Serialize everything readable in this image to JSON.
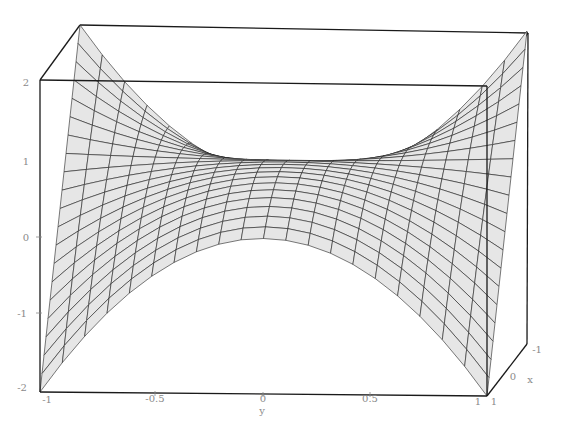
{
  "chart_data": {
    "type": "surface3d",
    "title": "",
    "function": "z = 2*x*y^2 style twisted saddle (visual estimate)",
    "x_range": [
      -1,
      1
    ],
    "y_range": [
      -1,
      1
    ],
    "z_range": [
      -2,
      2
    ],
    "xlabel": "x",
    "ylabel": "y",
    "zlabel": "",
    "x_ticks": [
      "-1",
      "0",
      "1"
    ],
    "y_ticks": [
      "-1",
      "-0.5",
      "0",
      "0.5",
      "1"
    ],
    "z_ticks": [
      "2",
      "1",
      "0",
      "-1",
      "-2"
    ],
    "grid": false,
    "mesh_lines": 20,
    "shading": {
      "top_face": "#e6e6e6",
      "bottom_face": "#9a9a9a"
    },
    "sample_points": [
      {
        "x": -1,
        "y": -1,
        "z": 2
      },
      {
        "x": 1,
        "y": -1,
        "z": -2
      },
      {
        "x": -1,
        "y": 1,
        "z": 2
      },
      {
        "x": 1,
        "y": 1,
        "z": -2
      },
      {
        "x": 0,
        "y": 0,
        "z": 0
      }
    ]
  },
  "axes": {
    "z_labels": [
      {
        "text": "2",
        "x": 26,
        "y": 86
      },
      {
        "text": "1",
        "x": 26,
        "y": 165
      },
      {
        "text": "0",
        "x": 26,
        "y": 241
      },
      {
        "text": "-1",
        "x": 22,
        "y": 317
      },
      {
        "text": "-2",
        "x": 22,
        "y": 391
      }
    ],
    "y_labels": [
      {
        "text": "-1",
        "x": 47,
        "y": 403
      },
      {
        "text": "-0.5",
        "x": 155,
        "y": 402
      },
      {
        "text": "0",
        "x": 263,
        "y": 402
      },
      {
        "text": "0.5",
        "x": 370,
        "y": 402
      },
      {
        "text": "1",
        "x": 478,
        "y": 405
      }
    ],
    "x_labels": [
      {
        "text": "1",
        "x": 494,
        "y": 405
      },
      {
        "text": "0",
        "x": 513,
        "y": 380
      },
      {
        "text": "-1",
        "x": 537,
        "y": 353
      }
    ],
    "y_title": {
      "text": "y",
      "x": 262,
      "y": 414
    },
    "x_title": {
      "text": "x",
      "x": 530,
      "y": 383
    }
  }
}
